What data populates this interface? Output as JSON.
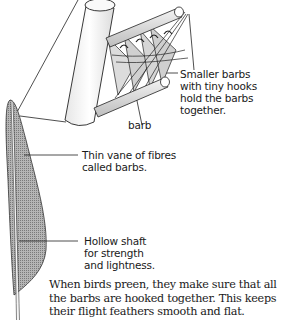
{
  "diagram": {
    "labels": {
      "hooks": "Smaller barbs\nwith tiny hooks\nhold the barbs\ntogether.",
      "barb": "barb",
      "vane": "Thin vane of fibres\ncalled barbs.",
      "shaft": "Hollow shaft\nfor strength\nand lightness."
    },
    "caption": "When birds preen, they make sure that all the barbs are hooked together. This keeps their flight feathers smooth and flat.",
    "colors": {
      "line": "#222222",
      "vane_fill": "#9a9a9a",
      "cylinder_fill": "#f2f2f2",
      "barbule_fill": "#d8d8d8",
      "background": "#ffffff"
    }
  }
}
